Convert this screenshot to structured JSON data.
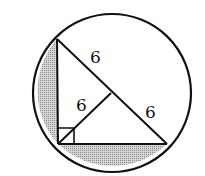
{
  "diagram": {
    "type": "geometry",
    "circle": {
      "cx": 112,
      "cy": 93,
      "r": 79
    },
    "triangle": {
      "top": {
        "x": 57,
        "y": 39
      },
      "right_angle": {
        "x": 58,
        "y": 144
      },
      "right": {
        "x": 167,
        "y": 144
      }
    },
    "midpoint": {
      "x": 111,
      "y": 93
    },
    "labels": {
      "upper_half_hypotenuse": "6",
      "median": "6",
      "lower_half_hypotenuse": "6"
    },
    "right_angle_marker": true,
    "colors": {
      "stroke": "#111111",
      "shade": "#b8b8b8",
      "background": "#ffffff"
    }
  }
}
